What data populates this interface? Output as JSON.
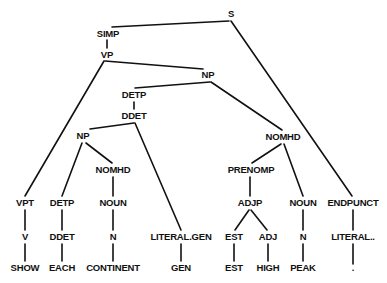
{
  "diagram": {
    "type": "parse-tree",
    "nodes": {
      "s": "S",
      "simp": "SIMP",
      "vp": "VP",
      "np_top": "NP",
      "detp_top": "DETP",
      "ddet_top": "DDET",
      "np_low": "NP",
      "nomhd_left": "NOMHD",
      "nomhd_right": "NOMHD",
      "prenomp": "PRENOMP",
      "adjp": "ADJP",
      "noun_right": "NOUN",
      "endpunct": "ENDPUNCT",
      "vpt": "VPT",
      "detp_low": "DETP",
      "noun_left": "NOUN",
      "v": "V",
      "ddet_low": "DDET",
      "n_left": "N",
      "literal_gen": "LITERAL.GEN",
      "est_cat": "EST",
      "adj": "ADJ",
      "n_right": "N",
      "literal_punct": "LITERAL..",
      "word_show": "SHOW",
      "word_each": "EACH",
      "word_continent": "CONTINENT",
      "word_gen": "GEN",
      "word_est": "EST",
      "word_high": "HIGH",
      "word_peak": "PEAK",
      "word_period": "."
    },
    "sentence": [
      "SHOW",
      "EACH",
      "CONTINENT",
      "GEN",
      "EST",
      "HIGH",
      "PEAK",
      "."
    ]
  }
}
